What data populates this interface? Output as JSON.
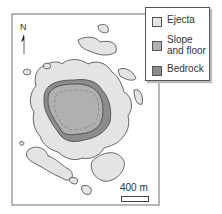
{
  "legend": {
    "items": [
      {
        "label": "Ejecta",
        "color": "#e4e4e4"
      },
      {
        "label": "Slope\nand floor",
        "color": "#b0b0b0"
      },
      {
        "label": "Bedrock",
        "color": "#8c8c8c"
      }
    ]
  },
  "north_label": "N",
  "scale_label": "400 m",
  "colors": {
    "frame": "#888888",
    "ejecta": "#e4e4e4",
    "slope": "#b0b0b0",
    "bedrock": "#8c8c8c",
    "outline": "#444444"
  }
}
